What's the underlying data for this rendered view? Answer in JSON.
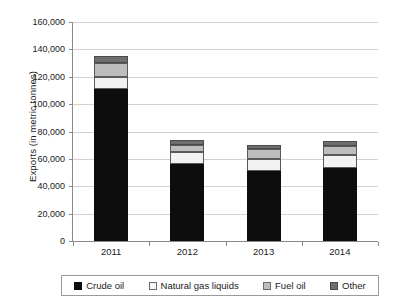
{
  "chart_data": {
    "type": "bar",
    "stacked": true,
    "title": "",
    "xlabel": "",
    "ylabel": "Exports (in metric tonnes)",
    "categories": [
      "2011",
      "2012",
      "2013",
      "2014"
    ],
    "ylim": [
      0,
      160000
    ],
    "ytick_step": 20000,
    "ytick_labels": [
      "160,000",
      "140,000",
      "120,000",
      "100,000",
      "80,000",
      "60,000",
      "40,000",
      "20,000",
      "0"
    ],
    "ytick_values": [
      160000,
      140000,
      120000,
      100000,
      80000,
      60000,
      40000,
      20000,
      0
    ],
    "grid": true,
    "legend_position": "bottom",
    "series": [
      {
        "name": "Crude oil",
        "color": "#0d0d0d",
        "values": [
          111000,
          56500,
          51000,
          53500
        ]
      },
      {
        "name": "Natural gas liquids",
        "color": "#f2f2f2",
        "values": [
          9000,
          8500,
          9000,
          9500
        ]
      },
      {
        "name": "Fuel oil",
        "color": "#bdbdbd",
        "values": [
          10000,
          5500,
          7500,
          6500
        ]
      },
      {
        "name": "Other",
        "color": "#6e6e6e",
        "values": [
          5000,
          3500,
          3000,
          3500
        ]
      }
    ],
    "totals": [
      135000,
      74000,
      70500,
      73000
    ]
  },
  "legend": {
    "items": [
      {
        "label": "Crude oil",
        "key": "crude"
      },
      {
        "label": "Natural gas liquids",
        "key": "ngl"
      },
      {
        "label": "Fuel oil",
        "key": "fuel"
      },
      {
        "label": "Other",
        "key": "other"
      }
    ]
  }
}
